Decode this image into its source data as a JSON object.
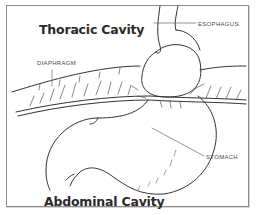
{
  "diagram": {
    "titles": {
      "top": "Thoracic Cavity",
      "bottom": "Abdominal Cavity"
    },
    "labels": {
      "esophagus": "Esophagus",
      "diaphragm": "Diaphragm",
      "stomach": "Stomach"
    },
    "colors": {
      "line": "#333333",
      "border": "#8a8a8a",
      "text": "#2a2a2a"
    }
  }
}
